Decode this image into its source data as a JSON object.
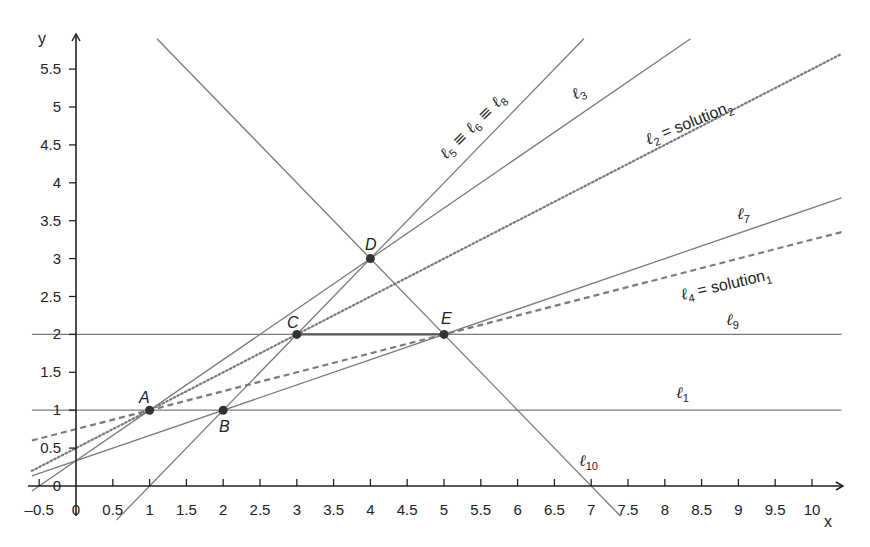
{
  "chart_data": {
    "type": "line",
    "title": "",
    "xlabel": "x",
    "ylabel": "y",
    "xlim": [
      -0.6,
      10.4
    ],
    "ylim": [
      -0.15,
      5.85
    ],
    "grid": false,
    "x_ticks": [
      "-0.5",
      "0",
      "0.5",
      "1",
      "1.5",
      "2",
      "2.5",
      "3",
      "3.5",
      "4",
      "4.5",
      "5",
      "5.5",
      "6",
      "6.5",
      "7",
      "7.5",
      "8",
      "8.5",
      "9",
      "9.5",
      "10"
    ],
    "y_ticks": [
      "0",
      "0.5",
      "1",
      "1.5",
      "2",
      "2.5",
      "3",
      "3.5",
      "4",
      "4.5",
      "5",
      "5.5"
    ],
    "points": [
      {
        "name": "A",
        "x": 1,
        "y": 1
      },
      {
        "name": "B",
        "x": 2,
        "y": 1
      },
      {
        "name": "C",
        "x": 3,
        "y": 2
      },
      {
        "name": "D",
        "x": 4,
        "y": 3
      },
      {
        "name": "E",
        "x": 5,
        "y": 2
      }
    ],
    "series": [
      {
        "name": "ℓ1",
        "label": "ℓ1",
        "equation": "y = 1",
        "style": "solid",
        "x": [
          -0.6,
          10.4
        ],
        "y": [
          1,
          1
        ]
      },
      {
        "name": "ℓ9",
        "label": "ℓ9",
        "equation": "y = 2",
        "style": "solid",
        "x": [
          -0.6,
          10.4
        ],
        "y": [
          2,
          2
        ]
      },
      {
        "name": "ℓ10",
        "label": "ℓ10",
        "equation": "y = -x + 7",
        "style": "solid",
        "x": [
          1.1,
          7.4
        ],
        "y": [
          5.9,
          -0.4
        ]
      },
      {
        "name": "ℓ5 ≡ ℓ6 ≡ ℓ8",
        "label": "ℓ5 ≡ ℓ6 ≡ ℓ8",
        "equation": "y = x - 1",
        "style": "solid",
        "x": [
          0.55,
          6.9
        ],
        "y": [
          -0.45,
          5.9
        ]
      },
      {
        "name": "ℓ3",
        "label": "ℓ3",
        "equation": "y = (2/3)x + 1/3",
        "style": "solid",
        "x": [
          -0.6,
          8.35
        ],
        "y": [
          -0.067,
          5.9
        ]
      },
      {
        "name": "ℓ2 = solution2",
        "label": "ℓ2 = solution2",
        "equation": "y = 0.5x + 0.5",
        "style": "dotted",
        "x": [
          -0.6,
          10.4
        ],
        "y": [
          0.2,
          5.7
        ]
      },
      {
        "name": "ℓ7",
        "label": "ℓ7",
        "equation": "y = x/3 + 1/3",
        "style": "solid",
        "x": [
          -0.6,
          10.4
        ],
        "y": [
          0.133,
          3.8
        ]
      },
      {
        "name": "ℓ4 = solution1",
        "label": "ℓ4 = solution1",
        "equation": "y = 0.25x + 0.75",
        "style": "dashed",
        "x": [
          -0.6,
          10.4
        ],
        "y": [
          0.6,
          3.35
        ]
      }
    ],
    "highlighted_segment": {
      "from": "C",
      "to": "E"
    },
    "colors": {
      "lines": "#7a7a7a",
      "axes": "#222222",
      "points": "#333333",
      "text": "#222222"
    }
  },
  "labels": {
    "x_axis": "x",
    "y_axis": "y",
    "points": {
      "A": "A",
      "B": "B",
      "C": "C",
      "D": "D",
      "E": "E"
    },
    "lines": {
      "l1": {
        "sym": "ℓ",
        "sub": "1",
        "suffix": ""
      },
      "l9": {
        "sym": "ℓ",
        "sub": "9",
        "suffix": ""
      },
      "l10": {
        "sym": "ℓ",
        "sub": "10",
        "suffix": ""
      },
      "l3": {
        "sym": "ℓ",
        "sub": "3",
        "suffix": ""
      },
      "l7": {
        "sym": "ℓ",
        "sub": "7",
        "suffix": ""
      },
      "l568": {
        "a": "ℓ",
        "a_sub": "5",
        "eq1": " ≡ ",
        "b": "ℓ",
        "b_sub": "6",
        "eq2": " ≡ ",
        "c": "ℓ",
        "c_sub": "8"
      },
      "l2": {
        "sym": "ℓ",
        "sub": "2",
        "eq": " = ",
        "word": "solution",
        "word_sub": "2"
      },
      "l4": {
        "sym": "ℓ",
        "sub": "4",
        "eq": " = ",
        "word": "solution",
        "word_sub": "1"
      }
    }
  }
}
